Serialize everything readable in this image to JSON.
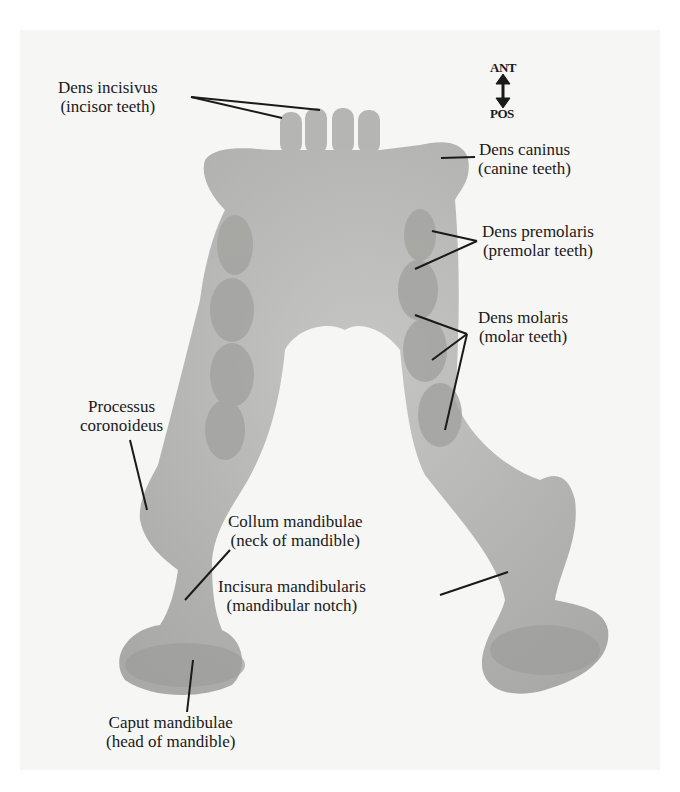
{
  "figure": {
    "orientation": {
      "top": "ANT",
      "bottom": "POS"
    },
    "colors": {
      "bone": "#b9b9b7",
      "bone_shadow": "#9d9d9b",
      "background": "#f6f6f4",
      "line": "#1a1a1a"
    },
    "labels": [
      {
        "id": "dens-incisivus",
        "latin": "Dens incisivus",
        "common": "(incisor teeth)"
      },
      {
        "id": "dens-caninus",
        "latin": "Dens caninus",
        "common": "(canine teeth)"
      },
      {
        "id": "dens-premolaris",
        "latin": "Dens premolaris",
        "common": "(premolar teeth)"
      },
      {
        "id": "dens-molaris",
        "latin": "Dens molaris",
        "common": "(molar teeth)"
      },
      {
        "id": "processus-coronoideus",
        "latin": "Processus",
        "common": "coronoideus"
      },
      {
        "id": "collum-mandibulae",
        "latin": "Collum mandibulae",
        "common": "(neck of mandible)"
      },
      {
        "id": "incisura-mandibularis",
        "latin": "Incisura mandibularis",
        "common": "(mandibular notch)"
      },
      {
        "id": "caput-mandibulae",
        "latin": "Caput mandibulae",
        "common": "(head of mandible)"
      }
    ]
  }
}
